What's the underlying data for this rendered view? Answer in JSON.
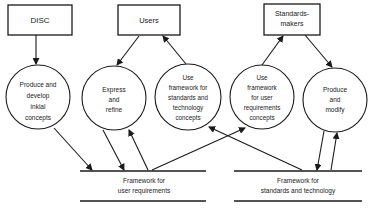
{
  "diagram": {
    "entities": [
      {
        "id": "disc",
        "lines": [
          "DISC"
        ]
      },
      {
        "id": "users",
        "lines": [
          "Users"
        ]
      },
      {
        "id": "standards-makers",
        "lines": [
          "Standards-",
          "makers"
        ]
      }
    ],
    "processes": [
      {
        "id": "produce-develop",
        "lines": [
          "Produce and",
          "develop",
          "inkial",
          "concepts"
        ]
      },
      {
        "id": "express-refine",
        "lines": [
          "Express",
          "and",
          "refine"
        ]
      },
      {
        "id": "use-std-framework",
        "lines": [
          "Use",
          "framework for",
          "standards and",
          "technology",
          "concepts"
        ]
      },
      {
        "id": "use-user-framework",
        "lines": [
          "Use",
          "framework",
          "for user",
          "requirements",
          "concepts"
        ]
      },
      {
        "id": "produce-modify",
        "lines": [
          "Produce",
          "and",
          "modify"
        ]
      }
    ],
    "stores": [
      {
        "id": "user-req",
        "lines": [
          "Framework for",
          "user requirements"
        ]
      },
      {
        "id": "std-tech",
        "lines": [
          "Framework for",
          "standards and technology"
        ]
      }
    ]
  }
}
